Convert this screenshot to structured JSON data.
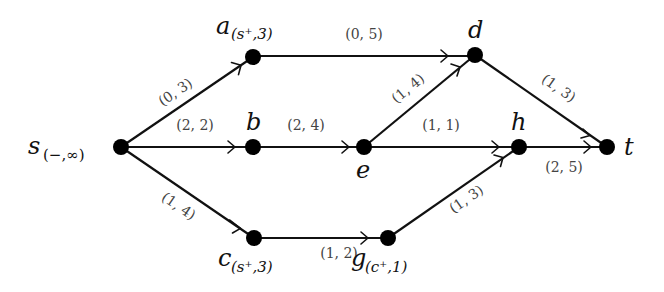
{
  "diagram": {
    "type": "flow-network",
    "colors": {
      "ink": "#111111",
      "label": "#444444",
      "background": "#ffffff"
    },
    "nodes": [
      {
        "id": "s",
        "name": "s",
        "label_sub": "(−,∞)",
        "x": 121,
        "y": 147
      },
      {
        "id": "a",
        "name": "a",
        "label_sub": "(s⁺,3)",
        "x": 253,
        "y": 57
      },
      {
        "id": "b",
        "name": "b",
        "label_sub": "",
        "x": 253,
        "y": 147
      },
      {
        "id": "c",
        "name": "c",
        "label_sub": "(s⁺,3)",
        "x": 254,
        "y": 238
      },
      {
        "id": "d",
        "name": "d",
        "label_sub": "",
        "x": 475,
        "y": 55
      },
      {
        "id": "e",
        "name": "e",
        "label_sub": "",
        "x": 364,
        "y": 147
      },
      {
        "id": "g",
        "name": "g",
        "label_sub": "(c⁺,1)",
        "x": 388,
        "y": 238
      },
      {
        "id": "h",
        "name": "h",
        "label_sub": "",
        "x": 519,
        "y": 147
      },
      {
        "id": "t",
        "name": "t",
        "label_sub": "",
        "x": 607,
        "y": 147
      }
    ],
    "edges": [
      {
        "from": "s",
        "to": "a",
        "label": "(0, 3)"
      },
      {
        "from": "s",
        "to": "b",
        "label": "(2, 2)"
      },
      {
        "from": "s",
        "to": "c",
        "label": "(1, 4)"
      },
      {
        "from": "a",
        "to": "d",
        "label": "(0, 5)"
      },
      {
        "from": "b",
        "to": "e",
        "label": "(2, 4)"
      },
      {
        "from": "e",
        "to": "d",
        "label": "(1, 4)"
      },
      {
        "from": "e",
        "to": "h",
        "label": "(1, 1)"
      },
      {
        "from": "d",
        "to": "t",
        "label": "(1, 3)"
      },
      {
        "from": "h",
        "to": "t",
        "label": "(2, 5)"
      },
      {
        "from": "c",
        "to": "g",
        "label": "(1, 2)"
      },
      {
        "from": "g",
        "to": "h",
        "label": "(1, 3)"
      }
    ]
  }
}
